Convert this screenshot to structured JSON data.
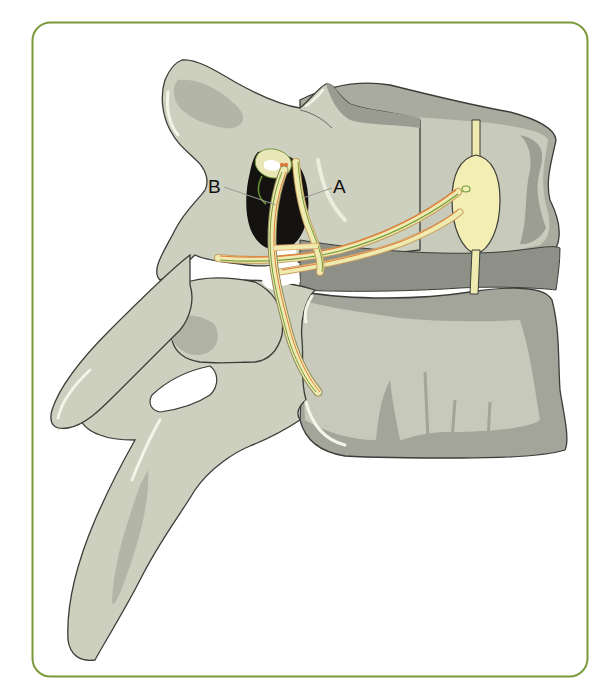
{
  "figure": {
    "frame": {
      "border_color": "#7a9a3a",
      "background": "#ffffff"
    },
    "colors": {
      "bone_light": "#cfd1c0",
      "bone_mid": "#b9bbab",
      "bone_dark": "#8f918a",
      "bone_outline": "#3b3d38",
      "highlight": "#f4f5e6",
      "foramen_dark": "#141312",
      "nerve_fill": "#efeab0",
      "nerve_orange": "#e07a3a",
      "nerve_green": "#6f9a3a",
      "ganglion_fill": "#f3eeb4",
      "leader_line": "#9a9c96"
    },
    "labels": [
      {
        "id": "A",
        "text": "A"
      },
      {
        "id": "B",
        "text": "B"
      }
    ]
  }
}
